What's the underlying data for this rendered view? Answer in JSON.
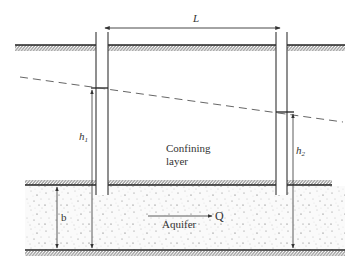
{
  "diagram": {
    "type": "confined-aquifer-cross-section",
    "labels": {
      "length": "L",
      "head_1": "h",
      "head_1_sub": "1",
      "head_2": "h",
      "head_2_sub": "2",
      "thickness": "b",
      "confining_layer_line1": "Confining",
      "confining_layer_line2": "layer",
      "aquifer": "Aquifer",
      "discharge": "Q"
    },
    "elements": [
      "ground-surface",
      "left-well",
      "right-well",
      "potentiometric-surface",
      "confining-layer",
      "aquifer",
      "aquifer-base"
    ],
    "colors": {
      "line": "#333333",
      "aquifer_fill": "#f4f4f4",
      "stipple": "#555555"
    }
  }
}
